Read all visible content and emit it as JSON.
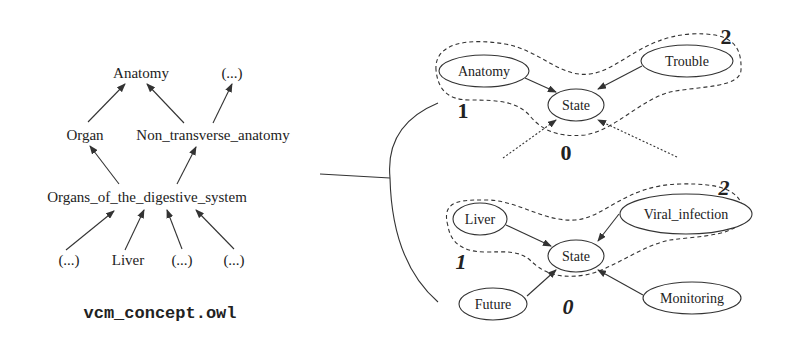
{
  "ontology": {
    "title": "vcm_concept.owl",
    "nodes": {
      "anatomy": "Anatomy",
      "ellipsis_top": "(...)",
      "organ": "Organ",
      "non_transverse_anatomy": "Non_transverse_anatomy",
      "organs_digestive": "Organs_of_the_digestive_system",
      "ellipsis_1": "(...)",
      "liver": "Liver",
      "ellipsis_2": "(...)",
      "ellipsis_3": "(...)"
    },
    "edges": [
      [
        "Organ",
        "Anatomy"
      ],
      [
        "Non_transverse_anatomy",
        "Anatomy"
      ],
      [
        "Non_transverse_anatomy",
        "(...)"
      ],
      [
        "Organs_of_the_digestive_system",
        "Organ"
      ],
      [
        "Organs_of_the_digestive_system",
        "Non_transverse_anatomy"
      ],
      [
        "(...)",
        "Organs_of_the_digestive_system"
      ],
      [
        "Liver",
        "Organs_of_the_digestive_system"
      ],
      [
        "(...)",
        "Organs_of_the_digestive_system"
      ],
      [
        "(...)",
        "Organs_of_the_digestive_system"
      ]
    ]
  },
  "graph_generic": {
    "nodes": {
      "anatomy": "Anatomy",
      "trouble": "Trouble",
      "state": "State"
    },
    "levels": {
      "one": "1",
      "two": "2",
      "zero": "0"
    }
  },
  "graph_instance": {
    "nodes": {
      "liver": "Liver",
      "viral_infection": "Viral_infection",
      "state": "State",
      "future": "Future",
      "monitoring": "Monitoring"
    },
    "levels": {
      "one": "1",
      "two": "2",
      "zero": "0"
    }
  }
}
